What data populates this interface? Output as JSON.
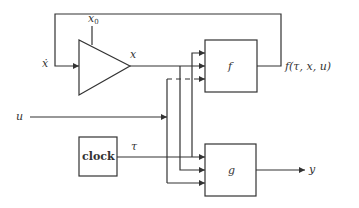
{
  "diagram": {
    "labels": {
      "x_dot": "ẋ",
      "x0": "x",
      "x0_sub": "0",
      "x": "x",
      "u": "u",
      "tau": "τ",
      "clock": "clock",
      "f": "f",
      "g": "g",
      "f_out": "f(τ, x, u)",
      "y": "y"
    },
    "blocks": [
      {
        "id": "integrator",
        "shape": "triangle"
      },
      {
        "id": "f",
        "shape": "rect",
        "inputs": [
          "tau",
          "x",
          "u"
        ]
      },
      {
        "id": "g",
        "shape": "rect",
        "inputs": [
          "tau",
          "x",
          "u"
        ]
      },
      {
        "id": "clock",
        "shape": "rect"
      }
    ],
    "colors": {
      "line": "#333333",
      "background": "#ffffff"
    }
  }
}
